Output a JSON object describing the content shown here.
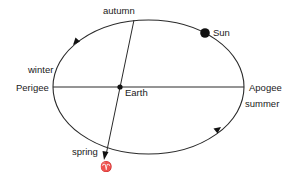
{
  "diagram": {
    "type": "orbit-diagram",
    "colors": {
      "stroke": "#2a2a2a",
      "dot": "#111111",
      "background": "#ffffff"
    },
    "labels": {
      "autumn": "autumn",
      "winter": "winter",
      "spring": "spring",
      "summer": "summer",
      "perigee": "Perigee",
      "apogee": "Apogee",
      "earth": "Earth",
      "sun": "Sun",
      "vernal_equinox_symbol": "♈"
    },
    "nodes": [
      {
        "id": "sun",
        "label": "Sun"
      },
      {
        "id": "earth",
        "label": "Earth"
      },
      {
        "id": "perigee",
        "label": "Perigee"
      },
      {
        "id": "apogee",
        "label": "Apogee"
      }
    ],
    "edges": [
      {
        "from": "perigee",
        "to": "apogee",
        "kind": "major-axis"
      },
      {
        "from": "autumn",
        "to": "spring",
        "kind": "equinox-line",
        "arrow": "spring"
      }
    ],
    "motion_direction": "counter-clockwise"
  }
}
